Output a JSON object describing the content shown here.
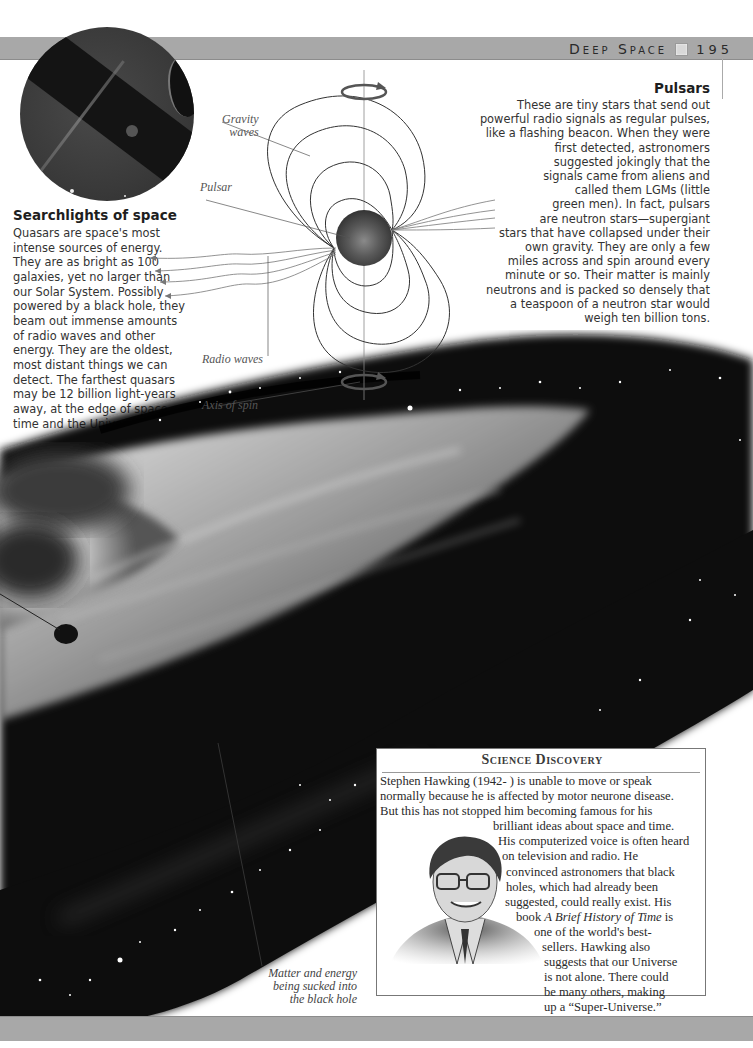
{
  "header": {
    "section_title": "Deep Space",
    "page_number": "195",
    "marker_icon": "square-marker"
  },
  "quasar_photo": {
    "description": "Photograph of a quasar with dark band and jet",
    "icon": "quasar-photo"
  },
  "searchlights": {
    "title": "Searchlights of space",
    "body": "Quasars are space's most intense sources of energy. They are as bright as 100 galaxies, yet no larger than our Solar System. Possibly powered by a black hole, they beam out immense amounts of radio waves and other energy. They are the oldest, most distant things we can detect. The farthest quasars may be 12 billion light-years away, at the edge of space, time and the Universe."
  },
  "pulsars": {
    "title": "Pulsars",
    "lines": [
      "These are tiny stars that send out",
      "powerful radio signals as regular pulses,",
      "like a flashing beacon. When they were",
      "first detected, astronomers",
      "suggested jokingly that the",
      "signals came from aliens and",
      "called them LGMs (little",
      "green men). In fact, pulsars",
      "are neutron stars—supergiant",
      "stars that have collapsed under their",
      "own gravity. They are only a few",
      "miles across and spin around every",
      "minute or so. Their matter is mainly",
      "neutrons and is packed so densely that",
      "a teaspoon of a neutron star would",
      "weigh ten billion tons."
    ]
  },
  "diagram": {
    "labels": {
      "gravity_waves_1": "Gravity",
      "gravity_waves_2": "waves",
      "pulsar": "Pulsar",
      "radio_waves": "Radio waves",
      "axis_of_spin": "Axis of spin"
    }
  },
  "galaxy": {
    "caption_lines": [
      "Matter and energy",
      "being sucked into",
      "the black hole"
    ]
  },
  "science_discovery": {
    "heading": "Science Discovery",
    "lines": [
      "Stephen Hawking (1942- ) is unable to move or speak",
      "normally because he is affected by motor neurone disease.",
      "But this has not stopped him becoming famous for his",
      "brilliant ideas about space and time.",
      "His computerized voice is often heard",
      "on television and radio. He",
      "convinced astronomers that black",
      "holes, which had already been",
      "suggested, could really exist. His",
      "book ",
      "one of the world's best-",
      "sellers. Hawking also",
      "suggests that our Universe",
      "is not alone. There could",
      "be many others, making",
      "up a “Super-Universe.”"
    ],
    "book_title": "A Brief History of Time",
    "book_suffix": " is",
    "portrait": "Stephen Hawking portrait illustration"
  },
  "colors": {
    "header_bar": "#a8a8a8",
    "text": "#333333",
    "diagram_line": "#3a3a3a",
    "pulsar_sphere": "#4a4a4a"
  }
}
